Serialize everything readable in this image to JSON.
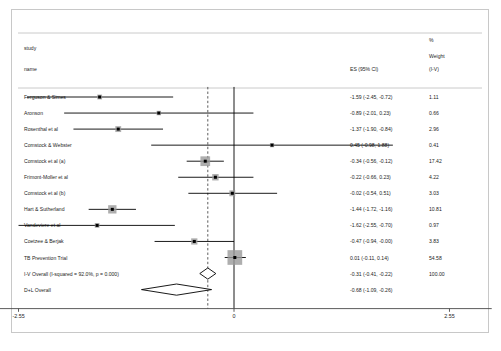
{
  "chart_data": {
    "type": "forest",
    "title": "",
    "headers": {
      "study_col": [
        "study",
        "name"
      ],
      "es_col": "ES (95% CI)",
      "weight_col": [
        "%",
        "Weight",
        "(I-V)"
      ]
    },
    "xlabel": "",
    "xticks": [
      "-2.55",
      "0",
      "2.55"
    ],
    "xtick_values": [
      -2.55,
      0,
      2.55
    ],
    "xlim": [
      -3.05,
      3.05
    ],
    "null_line": 0,
    "pooled_line": -0.31,
    "rows": [
      {
        "name": "Ferguson & Simes",
        "es": -1.59,
        "lo": -2.45,
        "hi": -0.72,
        "es_text": "-1.59 (-2.45, -0.72)",
        "weight": 1.11,
        "weight_text": "1.11",
        "type": "study"
      },
      {
        "name": "Aronson",
        "es": -0.89,
        "lo": -2.01,
        "hi": 0.23,
        "es_text": "-0.89 (-2.01, 0.23)",
        "weight": 0.66,
        "weight_text": "0.66",
        "type": "study"
      },
      {
        "name": "Rosenthal et al",
        "es": -1.37,
        "lo": -1.9,
        "hi": -0.84,
        "es_text": "-1.37 (-1.90, -0.84)",
        "weight": 2.96,
        "weight_text": "2.96",
        "type": "study"
      },
      {
        "name": "Comstock & Webster",
        "es": 0.45,
        "lo": -0.98,
        "hi": 1.88,
        "es_text": "0.45 (-0.98, 1.88)",
        "weight": 0.41,
        "weight_text": "0.41",
        "type": "study"
      },
      {
        "name": "Comstock et al (a)",
        "es": -0.34,
        "lo": -0.56,
        "hi": -0.12,
        "es_text": "-0.34 (-0.56, -0.12)",
        "weight": 17.42,
        "weight_text": "17.42",
        "type": "study"
      },
      {
        "name": "Frimont-Moller et al",
        "es": -0.22,
        "lo": -0.66,
        "hi": 0.23,
        "es_text": "-0.22 (-0.66, 0.23)",
        "weight": 4.22,
        "weight_text": "4.22",
        "type": "study"
      },
      {
        "name": "Comstock et al (b)",
        "es": -0.02,
        "lo": -0.54,
        "hi": 0.51,
        "es_text": "-0.02 (-0.54, 0.51)",
        "weight": 3.03,
        "weight_text": "3.03",
        "type": "study"
      },
      {
        "name": "Hart & Sutherland",
        "es": -1.44,
        "lo": -1.72,
        "hi": -1.16,
        "es_text": "-1.44 (-1.72, -1.16)",
        "weight": 10.81,
        "weight_text": "10.81",
        "type": "study"
      },
      {
        "name": "Vandeviere et al",
        "es": -1.62,
        "lo": -2.55,
        "hi": -0.7,
        "es_text": "-1.62 (-2.55, -0.70)",
        "weight": 0.97,
        "weight_text": "0.97",
        "type": "study"
      },
      {
        "name": "Coetzee & Berjak",
        "es": -0.47,
        "lo": -0.94,
        "hi": -0.0,
        "es_text": "-0.47 (-0.94, -0.00)",
        "weight": 3.83,
        "weight_text": "3.83",
        "type": "study"
      },
      {
        "name": "TB Prevention Trial",
        "es": 0.01,
        "lo": -0.11,
        "hi": 0.14,
        "es_text": "0.01 (-0.11, 0.14)",
        "weight": 54.58,
        "weight_text": "54.58",
        "type": "study"
      },
      {
        "name": "I-V Overall  (I-squared = 92.0%, p = 0.000)",
        "es": -0.31,
        "lo": -0.41,
        "hi": -0.22,
        "es_text": "-0.31 (-0.41, -0.22)",
        "weight": 100.0,
        "weight_text": "100.00",
        "type": "summary"
      },
      {
        "name": "D+L Overall",
        "es": -0.68,
        "lo": -1.09,
        "hi": -0.26,
        "es_text": "-0.68 (-1.09, -0.26)",
        "weight": null,
        "weight_text": "",
        "type": "summary"
      }
    ],
    "colors": {
      "marker_fill": "#9a9a9a",
      "line": "#000000",
      "frame": "#c8c8c8",
      "text": "#1d1d1d"
    },
    "grid": false,
    "legend": "none"
  }
}
